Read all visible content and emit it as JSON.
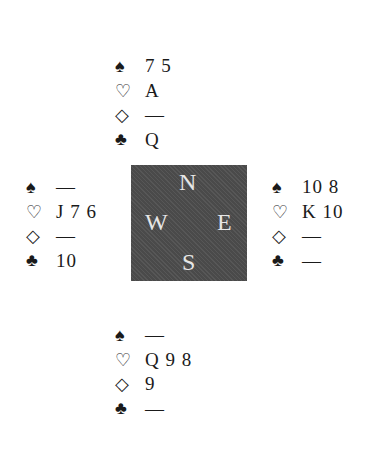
{
  "north": {
    "spades": "7 5",
    "hearts": "A",
    "diamonds": "—",
    "clubs": "Q"
  },
  "west": {
    "spades": "—",
    "hearts": "J 7 6",
    "diamonds": "—",
    "clubs": "10"
  },
  "east": {
    "spades": "10 8",
    "hearts": "K 10",
    "diamonds": "—",
    "clubs": "—"
  },
  "south": {
    "spades": "—",
    "hearts": "Q 9 8",
    "diamonds": "9",
    "clubs": "—"
  },
  "suits": {
    "spades": "♠",
    "hearts": "♡",
    "diamonds": "◇",
    "clubs": "♣"
  },
  "compass": {
    "n": "N",
    "e": "E",
    "s": "S",
    "w": "W"
  }
}
